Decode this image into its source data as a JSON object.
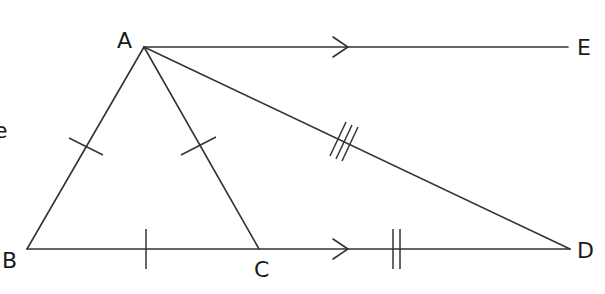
{
  "diagram": {
    "type": "geometry",
    "points": {
      "A": {
        "label": "A",
        "x": 144,
        "y": 47
      },
      "B": {
        "label": "B",
        "x": 27,
        "y": 249
      },
      "C": {
        "label": "C",
        "x": 259,
        "y": 249
      },
      "D": {
        "label": "D",
        "x": 570,
        "y": 249
      },
      "E": {
        "label": "E",
        "x": 568,
        "y": 47
      }
    },
    "segments": [
      "AB",
      "AC",
      "AD",
      "AE",
      "BD"
    ],
    "markings": {
      "single_tick": [
        "AB",
        "AC",
        "BC"
      ],
      "double_tick": [
        "CD"
      ],
      "triple_tick": [
        "AD"
      ],
      "parallel_arrows": [
        "AE",
        "BD"
      ]
    },
    "partial_text_left": "e",
    "stroke_color": "#333333"
  }
}
